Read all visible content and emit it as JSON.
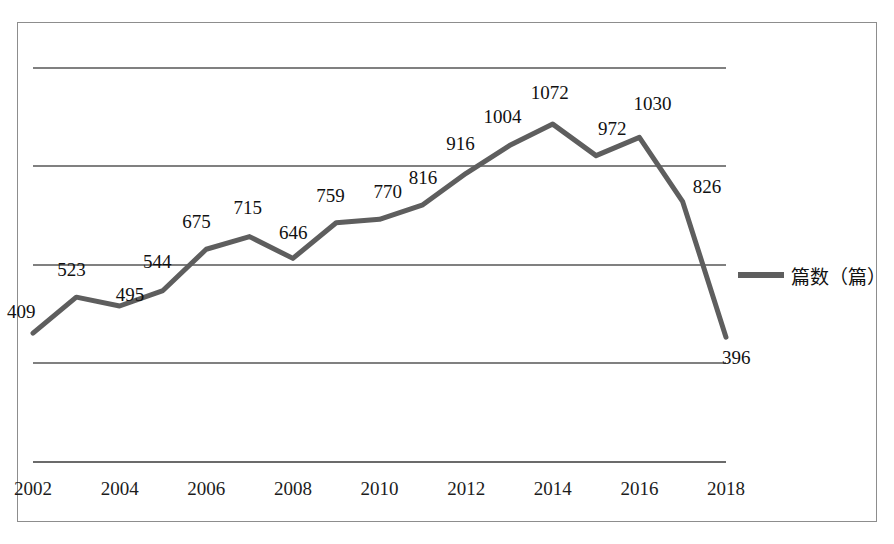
{
  "chart_data": {
    "type": "line",
    "title": "",
    "xlabel": "",
    "ylabel": "",
    "grid": true,
    "legend_position": "right",
    "xlim": [
      2002,
      2018
    ],
    "ylim": [
      0,
      1250
    ],
    "x": [
      2002,
      2003,
      2004,
      2005,
      2006,
      2007,
      2008,
      2009,
      2010,
      2011,
      2012,
      2013,
      2014,
      2015,
      2016,
      2017,
      2018
    ],
    "series": [
      {
        "name": "篇数（篇）",
        "color": "#5e5e5e",
        "values": [
          409,
          523,
          495,
          544,
          675,
          715,
          646,
          759,
          770,
          816,
          916,
          1004,
          1072,
          972,
          1030,
          826,
          396
        ]
      }
    ],
    "point_labels": [
      "409",
      "523",
      "495",
      "544",
      "675",
      "715",
      "646",
      "759",
      "770",
      "816",
      "916",
      "1004",
      "1072",
      "972",
      "1030",
      "826",
      "396"
    ],
    "xtick_labels": [
      "2002",
      "2004",
      "2006",
      "2008",
      "2010",
      "2012",
      "2014",
      "2016",
      "2018"
    ],
    "xtick_values": [
      2002,
      2004,
      2006,
      2008,
      2010,
      2012,
      2014,
      2016,
      2018
    ],
    "ytick_labels": [],
    "gridline_count": 5
  },
  "legend": {
    "label": "篇数（篇）",
    "swatch_color": "#5e5e5e"
  },
  "axis": {
    "line_color": "#6b6b6b",
    "grid_color": "#808080"
  },
  "frame": {
    "border_color": "#8d8d8d"
  }
}
